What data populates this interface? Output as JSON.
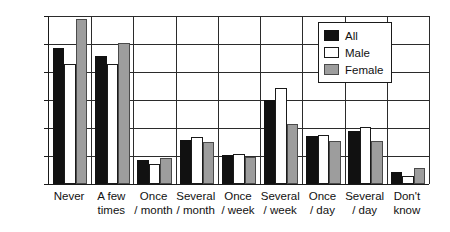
{
  "chart_data": {
    "type": "bar",
    "title": "",
    "subtitle": "",
    "xlabel": "",
    "ylabel": "",
    "ylim": [
      0,
      30
    ],
    "ytick_labels": [
      "30%",
      "25%",
      "20%",
      "15%",
      "10%",
      "5%",
      "0"
    ],
    "ytick_values": [
      30,
      25,
      20,
      15,
      10,
      5,
      0
    ],
    "grid": true,
    "legend_position": "top-right",
    "categories": [
      "Never",
      "A few times",
      "Once / month",
      "Several / month",
      "Once / week",
      "Several / week",
      "Once / day",
      "Several / day",
      "Don't know"
    ],
    "category_lines": [
      [
        "Never",
        ""
      ],
      [
        "A few",
        "times"
      ],
      [
        "Once",
        "/ month"
      ],
      [
        "Several",
        "/ month"
      ],
      [
        "Once",
        "/ week"
      ],
      [
        "Several",
        "/ week"
      ],
      [
        "Once",
        "/ day"
      ],
      [
        "Several",
        "/ day"
      ],
      [
        "Don't",
        "know"
      ]
    ],
    "series": [
      {
        "name": "All",
        "color": "#111111",
        "values": [
          24.3,
          22.9,
          4.2,
          7.9,
          5.2,
          15.0,
          8.5,
          9.4,
          2.1
        ]
      },
      {
        "name": "Male",
        "color": "#ffffff",
        "values": [
          21.5,
          21.5,
          3.6,
          8.4,
          5.4,
          17.2,
          8.7,
          10.2,
          1.4
        ]
      },
      {
        "name": "Female",
        "color": "#9d9d9d",
        "values": [
          29.5,
          25.1,
          4.7,
          7.5,
          4.9,
          10.7,
          7.6,
          7.7,
          2.8
        ]
      }
    ]
  },
  "legend": {
    "items": [
      {
        "label": "All"
      },
      {
        "label": "Male"
      },
      {
        "label": "Female"
      }
    ]
  }
}
